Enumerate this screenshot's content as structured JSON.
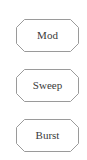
{
  "panel": {
    "buttons": [
      {
        "label": "Mod",
        "shape": "octagon"
      },
      {
        "label": "Sweep",
        "shape": "octagon"
      },
      {
        "label": "Burst",
        "shape": "octagon"
      }
    ]
  },
  "colors": {
    "background": "#ffffff",
    "button_border": "#9a9a9a",
    "button_fill": "#ffffff",
    "label_text": "#3a3a3a"
  }
}
